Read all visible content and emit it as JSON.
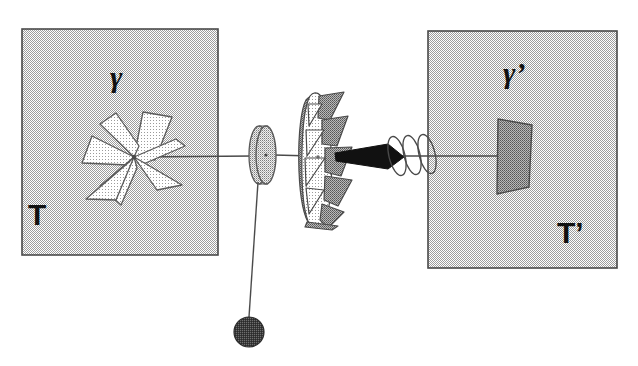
{
  "figure": {
    "background_color": "#ffffff"
  },
  "reservoirs": [
    {
      "id": "left",
      "box_fill": "#c9c9c9",
      "box_stroke": "#4a4a4a",
      "temperature_label": "T",
      "mechanism_label": "γ",
      "mechanism_name": "vane-paddle-wheel"
    },
    {
      "id": "right",
      "box_fill": "#c9c9c9",
      "box_stroke": "#4a4a4a",
      "temperature_label": "T’",
      "mechanism_label": "γ’",
      "mechanism_name": "ratchet-pawl-plate"
    }
  ],
  "components": {
    "axle_label": "axle-shaft",
    "spool_label": "string-spool",
    "ratchet_label": "ratchet-wheel",
    "pawl_label": "pawl",
    "spring_label": "pawl-spring",
    "string_label": "hanging-string",
    "weight_label": "hanging-weight",
    "vanes_label": "vane-blades"
  },
  "colors": {
    "line": "#4a4a4a",
    "line_dark": "#2b2b2b",
    "fill_light": "#dcdcdc",
    "fill_mid": "#c4c4c4",
    "fill_dark": "#9a9a9a",
    "solid_black": "#111111",
    "weight_fill": "#4f4f4f",
    "box_fill": "#c9c9c9"
  },
  "geometry": {
    "left_box": {
      "x": 22,
      "y": 29,
      "w": 196,
      "h": 226
    },
    "right_box": {
      "x": 428,
      "y": 31,
      "w": 189,
      "h": 237
    },
    "axle_y": 156,
    "hub": {
      "x": 134,
      "y": 157
    },
    "spool": {
      "cx": 264,
      "cy": 155,
      "rx": 11,
      "ry": 29
    },
    "ratchet": {
      "cx": 320,
      "cy": 157,
      "rx": 22,
      "ry": 68
    },
    "weight": {
      "cx": 249,
      "cy": 332,
      "r": 15
    },
    "plate": {
      "cx": 513,
      "cy": 156
    }
  }
}
